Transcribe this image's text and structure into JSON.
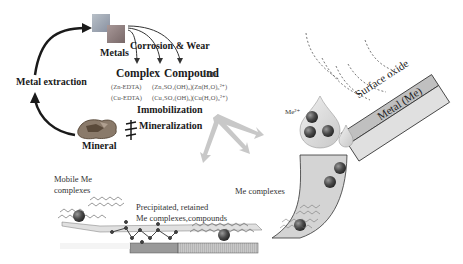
{
  "diagram": {
    "cycle": {
      "metals": "Metals",
      "corrosion_wear": "Corrosion & Wear",
      "metal_extraction": "Metal extraction",
      "mineral": "Mineral",
      "immobilization": "Immobilization",
      "mineralization": "Mineralization"
    },
    "species_header": {
      "complex": "Complex",
      "compound": "Compound",
      "ion": "Ion"
    },
    "species_rows": [
      {
        "complex": "(Zn-EDTA)",
        "compound": "(Zn₄SO₄(OH)₆)",
        "ion": "(Zn(H₂O)₆²⁺)"
      },
      {
        "complex": "(Cu-EDTA)",
        "compound": "(Cu₄SO₄(OH)₆)",
        "ion": "(Cu(H₂O)₆²⁺)"
      }
    ],
    "surface": {
      "oxide_label": "Surface oxide",
      "metal_label": "Metal (Me)",
      "ion_label": "Me²⁺"
    },
    "transport": {
      "mobile": [
        "Mobile Me",
        "complexes"
      ],
      "precipitated": [
        "Precipitated, retained",
        "Me complexes,compounds"
      ],
      "me_complexes": "Me complexes"
    },
    "colors": {
      "arrow_dark": "#1a1a1a",
      "arrow_gray": "#c8c8c8",
      "tube_fill": "#d4d4d4",
      "ball": "#555555",
      "oxide_fill": "#c0c0c0",
      "metal_fill": "#e0e0e0"
    }
  }
}
